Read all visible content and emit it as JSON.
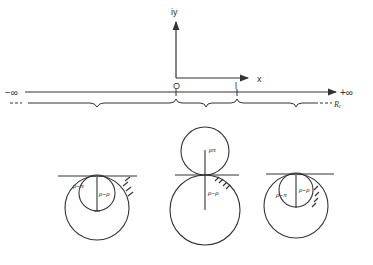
{
  "axes": {
    "y_label": "iy",
    "x_label": "x",
    "origin_label": "O",
    "unit_label": "l"
  },
  "real_line": {
    "left_label": "−∞",
    "right_label": "+∞",
    "bottom_label": "Rₑ"
  },
  "figures": [
    {
      "name": "left-region",
      "inner_label": "ρ₋π",
      "outer_label": "ρ₋ρ"
    },
    {
      "name": "middle-region",
      "upper_label": "ρπ",
      "lower_label": "ρ₋ρ"
    },
    {
      "name": "right-region",
      "inner_label": "ρ₋π",
      "outer_label": "ρ₋ρ"
    }
  ],
  "colors": {
    "ink": "#333333",
    "background": "#ffffff"
  }
}
